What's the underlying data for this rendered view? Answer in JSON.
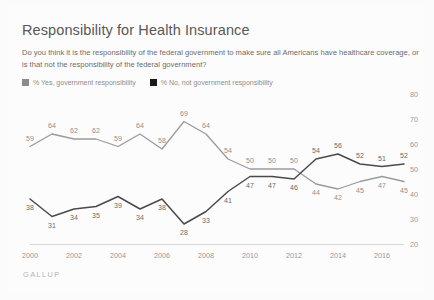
{
  "header": {
    "title": "Responsibility for Health Insurance",
    "subtitle": "Do you think it is the responsibility of the federal government to make sure all Americans have healthcare coverage, or is that not the responsibility of the federal government?"
  },
  "legend": [
    {
      "label": "% Yes, government responsibility",
      "color": "#8c8c8c",
      "key": "yes"
    },
    {
      "label": "% No, not government responsibility",
      "color": "#1a1a1a",
      "key": "no"
    }
  ],
  "footer": {
    "source": "GALLUP"
  },
  "colors": {
    "background": "#fbfbfb",
    "yes_line": "#9b9b9b",
    "no_line": "#4a4a4a",
    "axis": "#d8d8d8",
    "tick_text": "#9a9a9a",
    "data_label": "#8f8f8f",
    "title_text": "#585858",
    "subtitle_text": "#6d6d6d"
  },
  "chart_data": {
    "type": "line",
    "title": "Responsibility for Health Insurance",
    "subtitle": "Do you think it is the responsibility of the federal government to make sure all Americans have healthcare coverage, or is that not the responsibility of the federal government?",
    "xlabel": "",
    "ylabel": "",
    "ylim": [
      20,
      80
    ],
    "yticks": [
      20,
      30,
      40,
      50,
      60,
      70,
      80
    ],
    "ytick_labels": [
      "20",
      "30",
      "40",
      "50",
      "60",
      "70",
      "80"
    ],
    "xlim": [
      2000,
      2017
    ],
    "xticks": [
      2000,
      2002,
      2004,
      2006,
      2008,
      2010,
      2012,
      2014,
      2016
    ],
    "xtick_labels": [
      "2000",
      "2002",
      "2004",
      "2006",
      "2008",
      "2010",
      "2012",
      "2014",
      "2016"
    ],
    "grid": false,
    "legend_position": "top-left",
    "x": [
      2000,
      2001,
      2002,
      2003,
      2004,
      2005,
      2006,
      2007,
      2008,
      2009,
      2010,
      2011,
      2012,
      2013,
      2014,
      2015,
      2016,
      2017
    ],
    "series": [
      {
        "name": "% Yes, government responsibility",
        "color": "#9b9b9b",
        "values": [
          59,
          64,
          62,
          62,
          59,
          64,
          58,
          69,
          64,
          54,
          50,
          50,
          50,
          44,
          42,
          45,
          47,
          45
        ],
        "labels": [
          "59",
          "64",
          "62",
          "62",
          "59",
          "64",
          "58",
          "69",
          "64",
          "54",
          "50",
          "50",
          "50",
          "44",
          "42",
          "45",
          "47",
          "45"
        ]
      },
      {
        "name": "% No, not government responsibility",
        "color": "#4a4a4a",
        "values": [
          38,
          31,
          34,
          35,
          39,
          34,
          38,
          28,
          33,
          41,
          47,
          47,
          46,
          54,
          56,
          52,
          51,
          52
        ],
        "labels": [
          "38",
          "31",
          "34",
          "35",
          "39",
          "34",
          "38",
          "28",
          "33",
          "41",
          "47",
          "47",
          "46",
          "54",
          "56",
          "52",
          "51",
          "52"
        ]
      }
    ]
  }
}
